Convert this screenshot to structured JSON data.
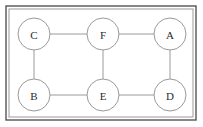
{
  "figure": {
    "background_color": "#ffffff",
    "frame": {
      "outer_border_color": "#555555",
      "inner_border_color": "#9a9a9a",
      "x": 6,
      "y": 6,
      "width": 190,
      "height": 114,
      "inner_inset": 3
    },
    "node_style": {
      "radius": 16,
      "stroke_color": "#9a9a9a",
      "stroke_width": 1,
      "fill_color": "#ffffff",
      "label_color": "#2b2b2b"
    },
    "edge_style": {
      "stroke_color": "#9a9a9a",
      "stroke_width": 1
    }
  },
  "graph_data": {
    "type": "node-link-diagram",
    "directed": false,
    "node_count": 6,
    "edge_count": 7,
    "nodes": [
      {
        "id": "C",
        "label": "C",
        "cx": 34,
        "cy": 34
      },
      {
        "id": "F",
        "label": "F",
        "cx": 103,
        "cy": 34
      },
      {
        "id": "A",
        "label": "A",
        "cx": 170,
        "cy": 34
      },
      {
        "id": "B",
        "label": "B",
        "cx": 34,
        "cy": 95
      },
      {
        "id": "E",
        "label": "E",
        "cx": 103,
        "cy": 95
      },
      {
        "id": "D",
        "label": "D",
        "cx": 170,
        "cy": 95
      }
    ],
    "edges": [
      {
        "source": "C",
        "target": "F",
        "x1": 50,
        "y1": 34,
        "x2": 87,
        "y2": 34
      },
      {
        "source": "F",
        "target": "A",
        "x1": 119,
        "y1": 34,
        "x2": 154,
        "y2": 34
      },
      {
        "source": "C",
        "target": "B",
        "x1": 34,
        "y1": 50,
        "x2": 34,
        "y2": 79
      },
      {
        "source": "F",
        "target": "E",
        "x1": 103,
        "y1": 50,
        "x2": 103,
        "y2": 79
      },
      {
        "source": "A",
        "target": "D",
        "x1": 170,
        "y1": 50,
        "x2": 170,
        "y2": 79
      },
      {
        "source": "B",
        "target": "E",
        "x1": 50,
        "y1": 95,
        "x2": 87,
        "y2": 95
      },
      {
        "source": "E",
        "target": "D",
        "x1": 119,
        "y1": 95,
        "x2": 154,
        "y2": 95
      }
    ],
    "adjacency": {
      "A": [
        "F",
        "D"
      ],
      "B": [
        "C",
        "E"
      ],
      "C": [
        "F",
        "B"
      ],
      "D": [
        "A",
        "E"
      ],
      "E": [
        "F",
        "B",
        "D"
      ],
      "F": [
        "C",
        "A",
        "E"
      ]
    }
  }
}
